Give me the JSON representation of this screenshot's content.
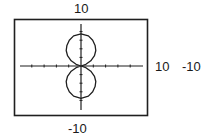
{
  "chart_data": {
    "type": "line",
    "title": "",
    "subtitle": "",
    "xlabel": "",
    "ylabel": "",
    "window": {
      "xmin": -10,
      "xmax": 10,
      "ymin": -10,
      "ymax": 10,
      "xscl": 2,
      "yscl": 2
    },
    "xlim": [
      -10,
      10
    ],
    "ylim": [
      -10,
      10
    ],
    "grid": false,
    "legend": null,
    "tick_marks": {
      "x": [
        -8,
        -6,
        -4,
        -2,
        2,
        4,
        6,
        8
      ],
      "y": [
        -8,
        -6,
        -4,
        -2,
        2,
        4,
        6,
        8
      ]
    },
    "series": [
      {
        "name": "curve",
        "closed": true,
        "approx_extent": {
          "y_max": 7.5,
          "y_min": -7.5,
          "x_halfwidth_max": 2.4
        },
        "points_upper_lobe": [
          [
            0,
            0
          ],
          [
            0.8,
            0.4
          ],
          [
            1.6,
            1.2
          ],
          [
            2.2,
            2.4
          ],
          [
            2.4,
            3.6
          ],
          [
            2.3,
            4.8
          ],
          [
            1.9,
            6.0
          ],
          [
            1.2,
            7.0
          ],
          [
            0,
            7.5
          ],
          [
            -1.2,
            7.0
          ],
          [
            -1.9,
            6.0
          ],
          [
            -2.3,
            4.8
          ],
          [
            -2.4,
            3.6
          ],
          [
            -2.2,
            2.4
          ],
          [
            -1.6,
            1.2
          ],
          [
            -0.8,
            0.4
          ],
          [
            0,
            0
          ]
        ],
        "points_lower_lobe": [
          [
            0,
            0
          ],
          [
            0.8,
            -0.4
          ],
          [
            1.6,
            -1.2
          ],
          [
            2.2,
            -2.4
          ],
          [
            2.4,
            -3.6
          ],
          [
            2.3,
            -4.8
          ],
          [
            1.9,
            -6.0
          ],
          [
            1.2,
            -7.0
          ],
          [
            0,
            -7.5
          ],
          [
            -1.2,
            -7.0
          ],
          [
            -1.9,
            -6.0
          ],
          [
            -2.3,
            -4.8
          ],
          [
            -2.4,
            -3.6
          ],
          [
            -2.2,
            -2.4
          ],
          [
            -1.6,
            -1.2
          ],
          [
            -0.8,
            -0.4
          ],
          [
            0,
            0
          ]
        ]
      }
    ],
    "annotations": [
      {
        "text": "10",
        "position": "top",
        "meaning": "Ymax"
      },
      {
        "text": "10",
        "position": "right",
        "meaning": "Xmax"
      },
      {
        "text": "-10",
        "position": "far-right",
        "meaning": "Xmin"
      },
      {
        "text": "-10",
        "position": "bottom",
        "meaning": "Ymin"
      }
    ]
  },
  "labels": {
    "top": "10",
    "right": "10",
    "far_right": "-10",
    "bottom": "-10"
  },
  "colors": {
    "frame": "#1f1f1f",
    "axes": "#1f1f1f",
    "curve": "#1f1f1f",
    "background": "#ffffff"
  }
}
